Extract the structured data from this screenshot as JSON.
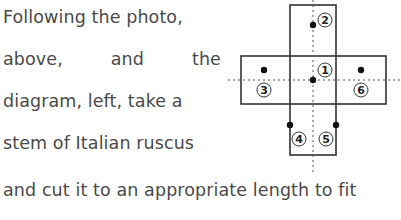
{
  "text": {
    "lines": [
      "Following the photo,",
      [
        "above,",
        "and",
        "the"
      ],
      "diagram, left, take a",
      "stem of Italian ruscus",
      "and cut it to an appropriate length to fit"
    ]
  },
  "diagram": {
    "labels": [
      "1",
      "2",
      "3",
      "4",
      "5",
      "6"
    ],
    "dots": [
      {
        "id": "dot-center",
        "x": 313,
        "y": 80
      },
      {
        "id": "dot-2",
        "x": 313,
        "y": 25
      },
      {
        "id": "dot-3",
        "x": 264,
        "y": 70
      },
      {
        "id": "dot-6",
        "x": 361,
        "y": 70
      },
      {
        "id": "dot-4",
        "x": 290,
        "y": 125
      },
      {
        "id": "dot-5",
        "x": 336,
        "y": 125
      }
    ]
  }
}
